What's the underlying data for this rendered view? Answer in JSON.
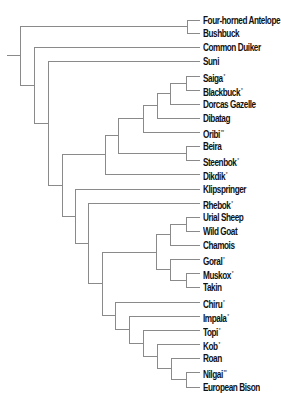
{
  "diagram": {
    "type": "phylogenetic-tree",
    "line_color": "#8a8a8a",
    "text_color": "#111111",
    "root_stem": {
      "x1": 7,
      "x2": 20
    },
    "label_x": 203,
    "leaf_end_x": 200,
    "leaves": [
      {
        "id": "four_horned_antelope",
        "label": "Four-horned Antelope",
        "mark": "",
        "y": 14
      },
      {
        "id": "bushbuck",
        "label": "Bushbuck",
        "mark": "",
        "y": 27
      },
      {
        "id": "common_duiker",
        "label": "Common Duiker",
        "mark": "",
        "y": 41
      },
      {
        "id": "suni",
        "label": "Suni",
        "mark": "",
        "y": 55
      },
      {
        "id": "saiga",
        "label": "Saiga",
        "mark": "*",
        "y": 70
      },
      {
        "id": "blackbuck",
        "label": "Blackbuck",
        "mark": "*",
        "y": 84
      },
      {
        "id": "dorcas_gazelle",
        "label": "Dorcas Gazelle",
        "mark": "",
        "y": 98
      },
      {
        "id": "dibatag",
        "label": "Dibatag",
        "mark": "",
        "y": 112
      },
      {
        "id": "oribi",
        "label": "Oribi",
        "mark": "**",
        "y": 126
      },
      {
        "id": "beira",
        "label": "Beira",
        "mark": "",
        "y": 140
      },
      {
        "id": "steenbok",
        "label": "Steenbok",
        "mark": "*",
        "y": 154
      },
      {
        "id": "dikdik",
        "label": "Dikdik",
        "mark": "*",
        "y": 168
      },
      {
        "id": "klipspringer",
        "label": "Klipspringer",
        "mark": "",
        "y": 183
      },
      {
        "id": "rhebok",
        "label": "Rhebok",
        "mark": "*",
        "y": 197
      },
      {
        "id": "urial_sheep",
        "label": "Urial Sheep",
        "mark": "",
        "y": 211
      },
      {
        "id": "wild_goat",
        "label": "Wild Goat",
        "mark": "",
        "y": 225
      },
      {
        "id": "chamois",
        "label": "Chamois",
        "mark": "",
        "y": 239
      },
      {
        "id": "goral",
        "label": "Goral",
        "mark": "*",
        "y": 253
      },
      {
        "id": "muskox",
        "label": "Muskox",
        "mark": "*",
        "y": 267
      },
      {
        "id": "takin",
        "label": "Takin",
        "mark": "",
        "y": 281
      },
      {
        "id": "chiru",
        "label": "Chiru",
        "mark": "*",
        "y": 296
      },
      {
        "id": "impala",
        "label": "Impala",
        "mark": "*",
        "y": 310
      },
      {
        "id": "topi",
        "label": "Topi",
        "mark": "*",
        "y": 324
      },
      {
        "id": "kob",
        "label": "Kob",
        "mark": "*",
        "y": 338
      },
      {
        "id": "roan",
        "label": "Roan",
        "mark": "",
        "y": 352
      },
      {
        "id": "nilgai",
        "label": "Nilgai",
        "mark": "**",
        "y": 366
      },
      {
        "id": "european_bison",
        "label": "European Bison",
        "mark": "",
        "y": 381
      }
    ],
    "tree": {
      "x": 20,
      "children": [
        {
          "x": 187,
          "children": [
            "four_horned_antelope",
            "bushbuck"
          ]
        },
        {
          "x": 34,
          "children": [
            "common_duiker",
            {
              "x": 48,
              "children": [
                "suni",
                {
                  "x": 62,
                  "children": [
                    {
                      "x": 105,
                      "children": [
                        {
                          "x": 118,
                          "children": [
                            {
                              "x": 143,
                              "children": [
                                {
                                  "x": 157,
                                  "children": [
                                    {
                                      "x": 170,
                                      "children": [
                                        {
                                          "x": 186,
                                          "children": [
                                            "saiga",
                                            "blackbuck"
                                          ]
                                        },
                                        "dorcas_gazelle"
                                      ]
                                    },
                                    "dibatag"
                                  ]
                                },
                                "oribi"
                              ]
                            },
                            {
                              "x": 186,
                              "children": [
                                "beira",
                                "steenbok"
                              ]
                            }
                          ]
                        },
                        "dikdik"
                      ]
                    },
                    {
                      "x": 75,
                      "children": [
                        "klipspringer",
                        {
                          "x": 88,
                          "children": [
                            "rhebok",
                            {
                              "x": 102,
                              "children": [
                                {
                                  "x": 156,
                                  "children": [
                                    {
                                      "x": 170,
                                      "children": [
                                        {
                                          "x": 186,
                                          "children": [
                                            "urial_sheep",
                                            "wild_goat"
                                          ]
                                        },
                                        "chamois"
                                      ]
                                    },
                                    {
                                      "x": 170,
                                      "children": [
                                        "goral",
                                        {
                                          "x": 186,
                                          "children": [
                                            "muskox",
                                            "takin"
                                          ]
                                        }
                                      ]
                                    }
                                  ]
                                },
                                {
                                  "x": 115,
                                  "children": [
                                    "chiru",
                                    {
                                      "x": 129,
                                      "children": [
                                        "impala",
                                        {
                                          "x": 143,
                                          "children": [
                                            "topi",
                                            {
                                              "x": 157,
                                              "children": [
                                                "kob",
                                                {
                                                  "x": 171,
                                                  "children": [
                                                    "roan",
                                                    {
                                                      "x": 186,
                                                      "children": [
                                                        "nilgai",
                                                        "european_bison"
                                                      ]
                                                    }
                                                  ]
                                                }
                                              ]
                                            }
                                          ]
                                        }
                                      ]
                                    }
                                  ]
                                }
                              ]
                            }
                          ]
                        }
                      ]
                    }
                  ]
                }
              ]
            }
          ]
        }
      ]
    }
  }
}
